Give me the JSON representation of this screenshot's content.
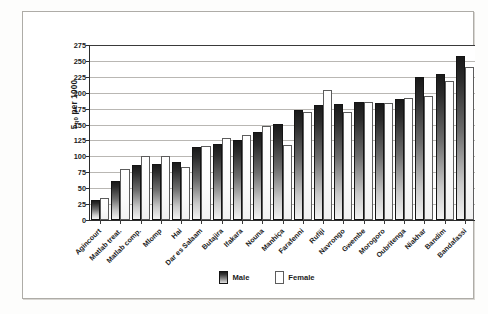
{
  "chart_data": {
    "type": "bar",
    "title": "",
    "xlabel": "",
    "ylabel": "5q0 per 1000",
    "ylabel_prefix": "5",
    "ylabel_sub": "q0",
    "ylabel_suffix": " per 1000",
    "ylim": [
      0,
      275
    ],
    "ytick_step": 25,
    "yticks": [
      275,
      250,
      225,
      200,
      175,
      150,
      125,
      100,
      75,
      50,
      25,
      0
    ],
    "ytick_labels": [
      "275",
      "250",
      "225",
      "200",
      "175",
      "150",
      "125",
      "100",
      "75",
      "50",
      "25",
      "0"
    ],
    "grid": true,
    "grid_axis": "y",
    "legend_position": "bottom-center",
    "categories": [
      "Agincourt",
      "Matlab treat.",
      "Matlab comp.",
      "Mlomp",
      "Hai",
      "Dar es Salaam",
      "Butajira",
      "Ifakara",
      "Nouna",
      "Manhiça",
      "Farafenni",
      "Rufiji",
      "Navrongo",
      "Gwembe",
      "Morogoro",
      "Oubritenga",
      "Niakhar",
      "Bandim",
      "Bandafassi"
    ],
    "series": [
      {
        "name": "Male",
        "color": "#2c2c2c",
        "values": [
          31,
          62,
          87,
          88,
          91,
          114,
          120,
          126,
          139,
          151,
          173,
          181,
          183,
          185,
          184,
          190,
          225,
          230,
          257
        ]
      },
      {
        "name": "Female",
        "color": "#ffffff",
        "values": [
          34,
          80,
          100,
          100,
          83,
          117,
          129,
          133,
          148,
          118,
          169,
          205,
          170,
          185,
          184,
          191,
          195,
          219,
          240
        ]
      }
    ]
  },
  "legend": {
    "items": [
      {
        "label": "Male",
        "swatch": "male"
      },
      {
        "label": "Female",
        "swatch": "female"
      }
    ]
  }
}
